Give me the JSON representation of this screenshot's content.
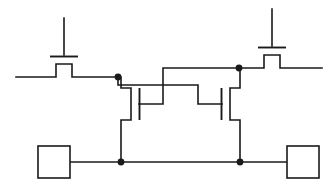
{
  "diagram": {
    "type": "circuit-schematic",
    "stroke_color": "#1a1a1a",
    "background_color": "#ffffff",
    "line_width": 1.6,
    "canvas": {
      "width": 336,
      "height": 184
    }
  },
  "transistors": [
    {
      "id": "left-access-transistor",
      "name": "left-pass-gate",
      "orientation": "horizontal",
      "gate_stem": {
        "x": 64,
        "y_top": 18,
        "y_bottom": 55
      },
      "gate_plate": {
        "x1": 50,
        "x2": 78,
        "y": 56
      },
      "channel": {
        "x1": 56,
        "x2": 72,
        "y": 64
      },
      "terminal_left": {
        "x": 16,
        "y": 77
      },
      "terminal_right": {
        "x": 118,
        "y": 77
      }
    },
    {
      "id": "right-access-transistor",
      "name": "right-pass-gate",
      "orientation": "horizontal",
      "gate_stem": {
        "x": 272,
        "y_top": 9,
        "y_bottom": 46
      },
      "gate_plate": {
        "x1": 258,
        "x2": 286,
        "y": 47
      },
      "channel": {
        "x1": 264,
        "x2": 280,
        "y": 55
      },
      "terminal_left": {
        "x": 239,
        "y": 68
      },
      "terminal_right": {
        "x": 322,
        "y": 68
      }
    },
    {
      "id": "left-driver-transistor",
      "name": "left-inverter-nmos",
      "orientation": "vertical",
      "gate_plate": {
        "x": 139,
        "y1": 88,
        "y2": 120
      },
      "gate_lead": {
        "x1": 139,
        "x2": 163,
        "y": 104
      },
      "channel": {
        "x": 131,
        "y1": 90,
        "y2": 118
      },
      "drain_node": {
        "x": 121,
        "y": 77
      },
      "source_node": {
        "x": 121,
        "y": 162
      }
    },
    {
      "id": "right-driver-transistor",
      "name": "right-inverter-nmos",
      "orientation": "vertical",
      "gate_plate": {
        "x": 222,
        "y": 88,
        "y2": 120
      },
      "gate_lead": {
        "x1": 198,
        "x2": 222,
        "y": 104
      },
      "channel": {
        "x": 230,
        "y1": 90,
        "y2": 118
      },
      "drain_node": {
        "x": 240,
        "y": 68
      },
      "source_node": {
        "x": 240,
        "y": 162
      }
    }
  ],
  "nodes": [
    {
      "id": "node-left-storage",
      "label": "left-storage-node",
      "x": 118,
      "y": 77,
      "radius": 3.4
    },
    {
      "id": "node-right-storage",
      "label": "right-storage-node",
      "x": 239,
      "y": 68,
      "radius": 3.4
    },
    {
      "id": "node-left-ground",
      "label": "left-ground-node",
      "x": 121,
      "y": 162,
      "radius": 3.4
    },
    {
      "id": "node-right-ground",
      "label": "right-ground-node",
      "x": 240,
      "y": 162,
      "radius": 3.4
    }
  ],
  "terminals": [
    {
      "id": "left-pad",
      "label": "left-square-terminal",
      "x": 38,
      "y": 146,
      "width": 32,
      "height": 32
    },
    {
      "id": "right-pad",
      "label": "right-square-terminal",
      "x": 287,
      "y": 146,
      "width": 32,
      "height": 32
    }
  ],
  "rails": {
    "bottom_rail": {
      "x1": 70,
      "x2": 287,
      "y": 162
    },
    "left_bitline": {
      "x1": 16,
      "x2": 118,
      "y": 77
    },
    "right_bitline": {
      "x1": 239,
      "x2": 322,
      "y": 68
    }
  },
  "cross_coupling": [
    {
      "id": "left-gate-feed",
      "label": "right-node-to-left-gate",
      "path": "from right storage node up and across to left transistor gate"
    },
    {
      "id": "right-gate-feed",
      "label": "left-node-to-right-gate",
      "path": "from left storage node across to right transistor gate"
    }
  ]
}
